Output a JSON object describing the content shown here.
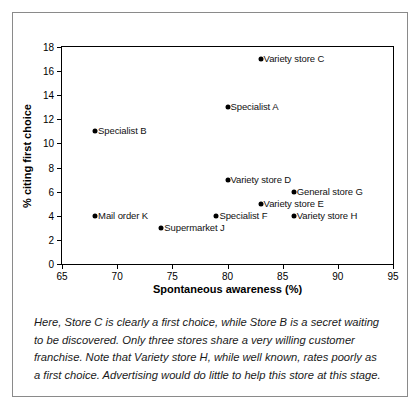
{
  "chart_data": {
    "type": "scatter",
    "title": "",
    "xlabel": "Spontaneous awareness (%)",
    "ylabel": "% citing first choice",
    "xlim": [
      65,
      95
    ],
    "ylim": [
      0,
      18
    ],
    "xticks": [
      65,
      70,
      75,
      80,
      85,
      90,
      95
    ],
    "yticks": [
      0,
      2,
      4,
      6,
      8,
      10,
      12,
      14,
      16,
      18
    ],
    "grid": false,
    "legend": "none",
    "points": [
      {
        "label": "Specialist B",
        "x": 68,
        "y": 11
      },
      {
        "label": "Mail order K",
        "x": 68,
        "y": 4
      },
      {
        "label": "Supermarket J",
        "x": 74,
        "y": 3
      },
      {
        "label": "Specialist F",
        "x": 79,
        "y": 4
      },
      {
        "label": "Variety store D",
        "x": 80,
        "y": 7
      },
      {
        "label": "Specialist A",
        "x": 80,
        "y": 13
      },
      {
        "label": "Variety store C",
        "x": 83,
        "y": 17
      },
      {
        "label": "Variety store E",
        "x": 83,
        "y": 5
      },
      {
        "label": "General store G",
        "x": 86,
        "y": 6
      },
      {
        "label": "Variety store H",
        "x": 86,
        "y": 4
      }
    ]
  },
  "caption": {
    "text": "Here, Store C is clearly a first choice, while Store B is a secret waiting to be discovered. Only three stores share a very willing customer franchise. Note that Variety store H, while well known, rates poorly as a first choice. Advertising would do little to help this store at this stage."
  },
  "colors": {
    "marker": "#000000",
    "axis": "#000000",
    "frame": "#8a8a8a",
    "background": "#ffffff"
  }
}
